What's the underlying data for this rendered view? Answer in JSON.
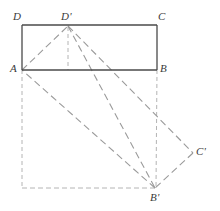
{
  "figure": {
    "background_color": "#ffffff",
    "width": 220,
    "height": 211,
    "solid_stroke_color": "#4a4a4a",
    "dashed_stroke_color": "#9a9a9a",
    "guide_stroke_color": "#b4b4b4",
    "label_color": "#3a3a3a"
  },
  "points": {
    "A": {
      "label": "A",
      "x": 22,
      "y": 70,
      "label_x": 10,
      "label_y": 63
    },
    "B": {
      "label": "B",
      "x": 157,
      "y": 70,
      "label_x": 160,
      "label_y": 63
    },
    "C": {
      "label": "C",
      "x": 157,
      "y": 25,
      "label_x": 158,
      "label_y": 11
    },
    "D": {
      "label": "D",
      "x": 22,
      "y": 25,
      "label_x": 13,
      "label_y": 11
    },
    "Dp": {
      "label": "D'",
      "x": 68,
      "y": 25,
      "label_x": 61,
      "label_y": 11
    },
    "Bp": {
      "label": "B'",
      "x": 155,
      "y": 188,
      "label_x": 150,
      "label_y": 192
    },
    "Cp": {
      "label": "C'",
      "x": 193,
      "y": 153,
      "label_x": 196,
      "label_y": 146
    }
  },
  "edges": {
    "rect_top": {
      "name": "D-C",
      "style": "solid"
    },
    "rect_bottom": {
      "name": "A-B",
      "style": "solid"
    },
    "rect_left": {
      "name": "D-A",
      "style": "solid"
    },
    "rect_right": {
      "name": "C-B",
      "style": "solid"
    },
    "rot_a_dp": {
      "name": "A-D'",
      "style": "dashed"
    },
    "rot_dp_cp": {
      "name": "D'-C'",
      "style": "dashed"
    },
    "rot_cp_bp": {
      "name": "C'-B'",
      "style": "dashed"
    },
    "rot_bp_a": {
      "name": "B'-A",
      "style": "dashed"
    },
    "alt_dp_bp": {
      "name": "D'-B'",
      "style": "dashed"
    },
    "guide_dp_v": {
      "name": "D'-vertical-drop",
      "style": "dashed"
    },
    "guide_b_v": {
      "name": "B-vertical-to-B'",
      "style": "dashed"
    },
    "guide_a_v": {
      "name": "A-vertical-down",
      "style": "dashed"
    },
    "guide_h": {
      "name": "bottom-horizontal-to-B'",
      "style": "dashed"
    }
  }
}
